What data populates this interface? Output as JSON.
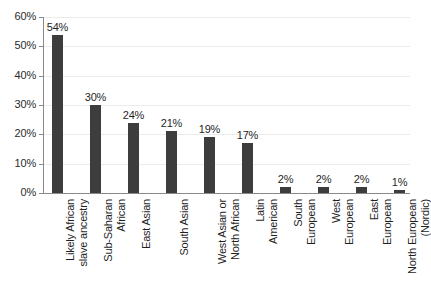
{
  "chart_data": {
    "type": "bar",
    "title": "",
    "xlabel": "",
    "ylabel": "",
    "ylim": [
      0,
      60
    ],
    "ytick_labels": [
      "0%",
      "10%",
      "20%",
      "30%",
      "40%",
      "50%",
      "60%"
    ],
    "ytick_values": [
      0,
      10,
      20,
      30,
      40,
      50,
      60
    ],
    "grid": true,
    "legend": "none",
    "bar_color": "#3d3d3d",
    "gridline_color": "#ebebeb",
    "axis_color": "#8a8a8a",
    "background_color": "#ffffff",
    "categories": [
      "Likely African\nslave ancestry",
      "Sub-Saharan\nAfrican",
      "East Asian",
      "South Asian",
      "West Asian or\nNorth African",
      "Latin\nAmerican",
      "South\nEuropean",
      "West\nEuropean",
      "East\nEuropean",
      "North European\n(Nordic)"
    ],
    "values": [
      54,
      30,
      24,
      21,
      19,
      17,
      2,
      2,
      2,
      1
    ],
    "data_labels": [
      "54%",
      "30%",
      "24%",
      "21%",
      "19%",
      "17%",
      "2%",
      "2%",
      "2%",
      "1%"
    ]
  }
}
